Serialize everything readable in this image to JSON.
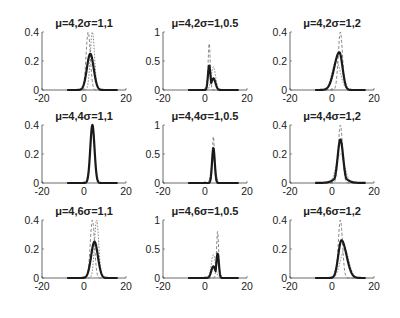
{
  "chart_data": {
    "type": "line",
    "layout": "3x3 subplot grid",
    "xlim": [
      -20,
      20
    ],
    "xticks": [
      -20,
      0,
      20
    ],
    "series_styles": [
      {
        "name": "estimated",
        "style": "solid thick",
        "color": "#1a1a1a"
      },
      {
        "name": "component-1",
        "style": "dashed",
        "color": "#666666"
      },
      {
        "name": "component-2",
        "style": "dashed",
        "color": "#666666"
      },
      {
        "name": "component-3",
        "style": "dotted",
        "color": "#888888"
      }
    ],
    "subplots": [
      {
        "row": 0,
        "col": 0,
        "title": "μ=4,2σ=1,1",
        "ylim": [
          0,
          0.4
        ],
        "yticks": [
          "0",
          "0.2",
          "0.4"
        ],
        "solid": {
          "mu": 3,
          "sigma": 1.6,
          "peak": 0.25
        },
        "dashed": [
          {
            "mu": 2,
            "sigma": 1.0,
            "peak": 0.4
          },
          {
            "mu": 4,
            "sigma": 1.0,
            "peak": 0.4
          }
        ]
      },
      {
        "row": 0,
        "col": 1,
        "title": "μ=4,2σ=1,0.5",
        "ylim": [
          0,
          1
        ],
        "yticks": [
          "0",
          "0.5",
          "1"
        ],
        "solid": {
          "mu": 2,
          "sigma": 0.6,
          "peak": 0.42,
          "second_mu": 4,
          "second_sigma": 1.0,
          "second_peak": 0.2
        },
        "dashed": [
          {
            "mu": 2,
            "sigma": 0.5,
            "peak": 0.8
          },
          {
            "mu": 4,
            "sigma": 1.0,
            "peak": 0.4
          }
        ]
      },
      {
        "row": 0,
        "col": 2,
        "title": "μ=4,2σ=1,2",
        "ylim": [
          0,
          0.4
        ],
        "yticks": [
          "0",
          "0.2",
          "0.4"
        ],
        "solid": {
          "mu": 3.5,
          "sigma": 1.5,
          "peak": 0.26,
          "skew": "left"
        },
        "dashed": [
          {
            "mu": 4,
            "sigma": 1.0,
            "peak": 0.4
          },
          {
            "mu": 2,
            "sigma": 2.0,
            "peak": 0.2
          }
        ]
      },
      {
        "row": 1,
        "col": 0,
        "title": "μ=4,4σ=1,1",
        "ylim": [
          0,
          0.4
        ],
        "yticks": [
          "0",
          "0.2",
          "0.4"
        ],
        "solid": {
          "mu": 4,
          "sigma": 1.0,
          "peak": 0.4
        },
        "dashed": [
          {
            "mu": 4,
            "sigma": 1.0,
            "peak": 0.4
          }
        ]
      },
      {
        "row": 1,
        "col": 1,
        "title": "μ=4,4σ=1,0.5",
        "ylim": [
          0,
          1
        ],
        "yticks": [
          "0",
          "0.5",
          "1"
        ],
        "solid": {
          "mu": 4,
          "sigma": 0.65,
          "peak": 0.6
        },
        "dashed": [
          {
            "mu": 4,
            "sigma": 0.5,
            "peak": 0.8
          },
          {
            "mu": 4,
            "sigma": 1.0,
            "peak": 0.4
          }
        ]
      },
      {
        "row": 1,
        "col": 2,
        "title": "μ=4,4σ=1,2",
        "ylim": [
          0,
          0.4
        ],
        "yticks": [
          "0",
          "0.2",
          "0.4"
        ],
        "solid": {
          "mu": 4,
          "sigma": 1.3,
          "peak": 0.3,
          "heavy_tails": true
        },
        "dashed": [
          {
            "mu": 4,
            "sigma": 1.0,
            "peak": 0.4
          },
          {
            "mu": 4,
            "sigma": 2.0,
            "peak": 0.2
          }
        ]
      },
      {
        "row": 2,
        "col": 0,
        "title": "μ=4,6σ=1,1",
        "ylim": [
          0,
          0.4
        ],
        "yticks": [
          "0",
          "0.2",
          "0.4"
        ],
        "solid": {
          "mu": 5,
          "sigma": 1.6,
          "peak": 0.25
        },
        "dashed": [
          {
            "mu": 4,
            "sigma": 1.0,
            "peak": 0.4
          },
          {
            "mu": 6,
            "sigma": 1.0,
            "peak": 0.4
          }
        ]
      },
      {
        "row": 2,
        "col": 1,
        "title": "μ=4,6σ=1,0.5",
        "ylim": [
          0,
          1
        ],
        "yticks": [
          "0",
          "0.5",
          "1"
        ],
        "solid": {
          "mu": 6,
          "sigma": 0.6,
          "peak": 0.42,
          "second_mu": 4,
          "second_sigma": 1.0,
          "second_peak": 0.2
        },
        "dashed": [
          {
            "mu": 6,
            "sigma": 0.5,
            "peak": 0.8
          },
          {
            "mu": 4,
            "sigma": 1.0,
            "peak": 0.4
          }
        ]
      },
      {
        "row": 2,
        "col": 2,
        "title": "μ=4,6σ=1,2",
        "ylim": [
          0,
          0.4
        ],
        "yticks": [
          "0",
          "0.2",
          "0.4"
        ],
        "solid": {
          "mu": 4.5,
          "sigma": 1.5,
          "peak": 0.26,
          "skew": "right"
        },
        "dashed": [
          {
            "mu": 4,
            "sigma": 1.0,
            "peak": 0.4
          },
          {
            "mu": 6,
            "sigma": 2.0,
            "peak": 0.2
          }
        ]
      }
    ]
  }
}
